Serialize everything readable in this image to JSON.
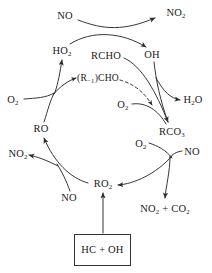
{
  "diagram": {
    "type": "reaction-cycle",
    "stroke_color": "#2b2b2b",
    "text_color": "#1a1a1a",
    "background": "#ffffff",
    "box_border_color": "#333333"
  },
  "species": {
    "no_top": {
      "label": "NO",
      "x": 65,
      "y": 16
    },
    "no2_top": {
      "label": "NO2",
      "formula_html": "NO<sub>2</sub>",
      "x": 176,
      "y": 13
    },
    "ho2": {
      "label": "HO2",
      "formula_html": "HO<sub>2</sub>",
      "x": 62,
      "y": 51
    },
    "rcho": {
      "label": "RCHO",
      "formula_html": "RCHO",
      "x": 106,
      "y": 56
    },
    "oh": {
      "label": "OH",
      "formula_html": "OH",
      "x": 152,
      "y": 55
    },
    "r_minus_1_cho": {
      "label": "(R-1)CHO",
      "formula_html": "(R<sub>&minus;1</sub>)CHO",
      "x": 98,
      "y": 78
    },
    "o2_left": {
      "label": "O2",
      "formula_html": "O<sub>2</sub>",
      "x": 13,
      "y": 100
    },
    "o2_middle": {
      "label": "O2",
      "formula_html": "O<sub>2</sub>",
      "x": 123,
      "y": 105
    },
    "h2o": {
      "label": "H2O",
      "formula_html": "H<sub>2</sub>O",
      "x": 193,
      "y": 100
    },
    "rco3": {
      "label": "RCO3",
      "formula_html": "RCO<sub>3</sub>",
      "x": 172,
      "y": 132
    },
    "ro": {
      "label": "RO",
      "formula_html": "RO",
      "x": 41,
      "y": 129
    },
    "o2_right": {
      "label": "O2",
      "formula_html": "O<sub>2</sub>",
      "x": 141,
      "y": 144
    },
    "no_right": {
      "label": "NO",
      "formula_html": "NO",
      "x": 192,
      "y": 152
    },
    "no2_left": {
      "label": "NO2",
      "formula_html": "NO<sub>2</sub>",
      "x": 18,
      "y": 154
    },
    "no_bottom_left": {
      "label": "NO",
      "formula_html": "NO",
      "x": 69,
      "y": 198
    },
    "ro2": {
      "label": "RO2",
      "formula_html": "RO<sub>2</sub>",
      "x": 103,
      "y": 184
    },
    "no2_co2": {
      "label": "NO2 + CO2",
      "formula_html": "NO<sub>2</sub> + CO<sub>2</sub>",
      "x": 165,
      "y": 209
    },
    "hc_oh": {
      "label": "HC + OH",
      "formula_html": "HC + OH",
      "x": 102,
      "y": 250
    }
  },
  "source_box": {
    "label": "HC + OH",
    "x": 74,
    "y": 234,
    "width": 57,
    "height": 32
  },
  "arrows": [
    {
      "name": "no-to-no2",
      "from": "no_top",
      "to": "no2_top",
      "style": "solid"
    },
    {
      "name": "ho2-to-oh",
      "from": "ho2",
      "to": "oh",
      "style": "solid"
    },
    {
      "name": "ro-to-ho2",
      "from": "ro",
      "to": "ho2",
      "style": "solid"
    },
    {
      "name": "ro-to-r-minus-1-cho",
      "from": "ro",
      "to": "r_minus_1_cho",
      "style": "solid"
    },
    {
      "name": "o2-left-join",
      "from": "o2_left",
      "to": "ro-branch",
      "style": "solid"
    },
    {
      "name": "rcho-to-rco3",
      "from": "rcho",
      "to": "rco3",
      "style": "solid"
    },
    {
      "name": "oh-to-rco3",
      "from": "oh",
      "to": "rco3",
      "style": "solid"
    },
    {
      "name": "oh-to-h2o",
      "from": "oh",
      "to": "h2o",
      "style": "solid"
    },
    {
      "name": "r-minus-1-cho-dashed",
      "from": "r_minus_1_cho",
      "to": "rco3-path",
      "style": "dashed"
    },
    {
      "name": "o2-middle-join",
      "from": "o2_middle",
      "to": "rco3",
      "style": "solid"
    },
    {
      "name": "rco3-to-ro2",
      "from": "rco3",
      "to": "ro2",
      "style": "solid"
    },
    {
      "name": "o2-right-join",
      "from": "o2_right",
      "to": "rco3-branch",
      "style": "solid"
    },
    {
      "name": "no-right-join",
      "from": "no_right",
      "to": "rco3-branch",
      "style": "solid"
    },
    {
      "name": "rco3-to-no2-co2",
      "from": "rco3",
      "to": "no2_co2",
      "style": "solid"
    },
    {
      "name": "ro2-to-ro",
      "from": "ro2",
      "to": "ro",
      "style": "solid"
    },
    {
      "name": "ro2-to-no2-left",
      "from": "ro2",
      "to": "no2_left",
      "style": "solid"
    },
    {
      "name": "no-bottom-left-join",
      "from": "no_bottom_left",
      "to": "ro2-branch",
      "style": "solid"
    },
    {
      "name": "source-to-ro2",
      "from": "source_box",
      "to": "ro2",
      "style": "solid"
    }
  ]
}
